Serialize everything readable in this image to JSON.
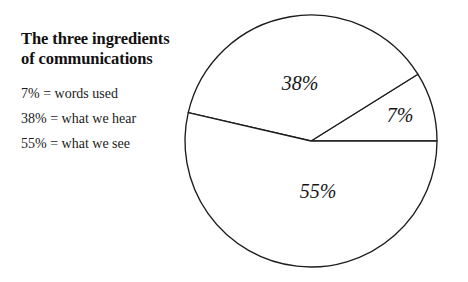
{
  "canvas": {
    "width": 468,
    "height": 282,
    "background": "#ffffff"
  },
  "legend": {
    "title_line1": "The three ingredients",
    "title_line2": "of communications",
    "items": [
      "7% = words used",
      "38% = what we hear",
      "55% = what we see"
    ]
  },
  "chart_data": {
    "type": "pie",
    "title": "The three ingredients of communications",
    "subtitle": "",
    "xlabel": "",
    "ylabel": "",
    "legend_position": "left",
    "grid": false,
    "categories": [
      "words used",
      "what we hear",
      "what we see"
    ],
    "values": [
      7,
      38,
      55
    ],
    "value_unit": "%",
    "data_labels": [
      "7%",
      "38%",
      "55%"
    ],
    "colors": [
      "#ffffff",
      "#ffffff",
      "#ffffff"
    ],
    "stroke_color": "#1c1c1c",
    "geometry": {
      "center_x": 311,
      "center_y": 141,
      "radius": 126,
      "start_angle_deg": 0,
      "direction": "counterclockwise",
      "slice_boundaries_deg": [
        0,
        32,
        167,
        360
      ]
    },
    "label_positions": [
      {
        "text": "7%",
        "x": 400,
        "y": 117
      },
      {
        "text": "38%",
        "x": 300,
        "y": 85
      },
      {
        "text": "55%",
        "x": 318,
        "y": 193
      }
    ]
  }
}
